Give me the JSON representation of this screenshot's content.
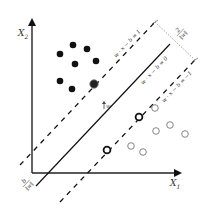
{
  "diagram": {
    "type": "svm-maximum-margin",
    "axes": {
      "x_label": "X",
      "x_sub": "1",
      "y_label": "X",
      "y_sub": "2"
    },
    "lines": {
      "hyperplane_label": "w · x − b = 0",
      "upper_margin_label": "w · x − b = 1",
      "lower_margin_label": "w · x − b = −1"
    },
    "annotations": {
      "margin_width": "2/‖w‖",
      "margin_num": "2",
      "margin_den": "‖w‖",
      "offset": "b/‖w‖",
      "offset_num": "b",
      "offset_den": "‖w‖",
      "normal_vector": "w"
    },
    "class_filled_points": [
      [
        60,
        54
      ],
      [
        73,
        45
      ],
      [
        87,
        49
      ],
      [
        75,
        64
      ],
      [
        96,
        61
      ],
      [
        60,
        81
      ],
      [
        72,
        89
      ]
    ],
    "class_filled_support_vectors": [
      [
        94,
        84
      ]
    ],
    "class_open_points": [
      [
        155,
        108
      ],
      [
        170,
        125
      ],
      [
        156,
        131
      ],
      [
        185,
        134
      ],
      [
        131,
        146
      ],
      [
        143,
        152
      ]
    ],
    "class_open_support_vectors": [
      [
        139,
        117
      ],
      [
        107,
        150
      ]
    ],
    "colors": {
      "ink": "#111111",
      "open_circle": "#777777",
      "dotted": "#888888"
    }
  }
}
